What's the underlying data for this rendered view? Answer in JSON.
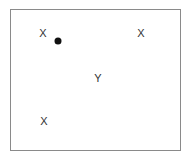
{
  "diagram": {
    "markers": [
      {
        "id": "x1",
        "symbol": "X",
        "x": 43,
        "y": 33
      },
      {
        "id": "x2",
        "symbol": "X",
        "x": 141,
        "y": 33
      },
      {
        "id": "x3",
        "symbol": "X",
        "x": 44,
        "y": 121
      },
      {
        "id": "y1",
        "symbol": "Y",
        "x": 98,
        "y": 78
      }
    ],
    "dot": {
      "x": 58,
      "y": 41,
      "color": "#111111"
    }
  }
}
